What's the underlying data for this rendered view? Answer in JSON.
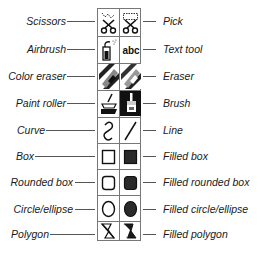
{
  "diagram": {
    "left_labels": [
      "Scissors",
      "Airbrush",
      "Color eraser",
      "Paint roller",
      "Curve",
      "Box",
      "Rounded box",
      "Circle/ellipse",
      "Polygon"
    ],
    "right_labels": [
      "Pick",
      "Text tool",
      "Eraser",
      "Brush",
      "Line",
      "Filled box",
      "Filled rounded box",
      "Filled circle/ellipse",
      "Filled polygon"
    ],
    "tools": [
      {
        "left": "scissors-icon",
        "right": "pick-icon"
      },
      {
        "left": "airbrush-icon",
        "right": "text-tool-icon"
      },
      {
        "left": "color-eraser-icon",
        "right": "eraser-icon"
      },
      {
        "left": "paint-roller-icon",
        "right": "brush-icon"
      },
      {
        "left": "curve-icon",
        "right": "line-icon"
      },
      {
        "left": "box-icon",
        "right": "filled-box-icon"
      },
      {
        "left": "rounded-box-icon",
        "right": "filled-rounded-box-icon"
      },
      {
        "left": "ellipse-icon",
        "right": "filled-ellipse-icon"
      },
      {
        "left": "polygon-icon",
        "right": "filled-polygon-icon"
      }
    ],
    "text_tool_glyph": "abc"
  }
}
